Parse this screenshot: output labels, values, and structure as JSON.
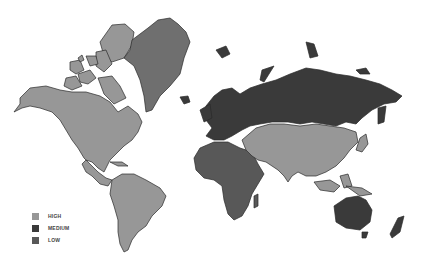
{
  "map": {
    "type": "world choropleth",
    "colors": {
      "high": "#979797",
      "high_alt": "#6f6f6f",
      "medium": "#3a3a3a",
      "low": "#585858",
      "background": "#ffffff",
      "border": "#2a2a2a"
    },
    "regions": [
      {
        "name": "North America",
        "level": "HIGH"
      },
      {
        "name": "Canadian Arctic Islands",
        "level": "HIGH"
      },
      {
        "name": "Greenland",
        "level": "HIGH"
      },
      {
        "name": "South America",
        "level": "HIGH"
      },
      {
        "name": "Middle East & Asia",
        "level": "HIGH"
      },
      {
        "name": "Southeast Asia",
        "level": "HIGH"
      },
      {
        "name": "Europe & Russia",
        "level": "MEDIUM"
      },
      {
        "name": "Japan",
        "level": "HIGH"
      },
      {
        "name": "Australia",
        "level": "MEDIUM"
      },
      {
        "name": "New Zealand",
        "level": "MEDIUM"
      },
      {
        "name": "Africa",
        "level": "LOW"
      },
      {
        "name": "Madagascar",
        "level": "LOW"
      }
    ]
  },
  "legend": {
    "items": [
      {
        "label": "HIGH",
        "color": "#979797"
      },
      {
        "label": "MEDIUM",
        "color": "#3a3a3a"
      },
      {
        "label": "LOW",
        "color": "#585858"
      }
    ]
  }
}
